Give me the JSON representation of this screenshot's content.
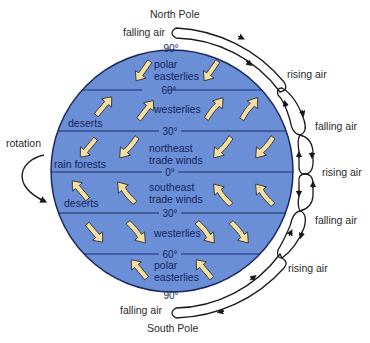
{
  "diagram": {
    "poles": {
      "north": "North Pole",
      "south": "South Pole"
    },
    "latitudes": [
      "90°",
      "60°",
      "30°",
      "0°",
      "30°",
      "60°",
      "90°"
    ],
    "wind_belts": {
      "north_polar": [
        "polar",
        "easterlies"
      ],
      "north_westerlies": "westerlies",
      "northeast_trades": [
        "northeast",
        "trade winds"
      ],
      "southeast_trades": [
        "southeast",
        "trade winds"
      ],
      "south_westerlies": "westerlies",
      "south_polar": [
        "polar",
        "easterlies"
      ]
    },
    "climate_zones": {
      "north_deserts": "deserts",
      "rain_forests": "rain forests",
      "south_deserts": "deserts"
    },
    "rotation_label": "rotation",
    "cell_labels": {
      "north_pole": "falling air",
      "north_60": "rising air",
      "north_30": "falling air",
      "equator": "rising air",
      "south_30": "falling air",
      "south_60": "rising air",
      "south_pole": "falling air"
    },
    "colors": {
      "globe_fill": "#6b8fd6",
      "globe_stroke": "#1a2a5a",
      "arrow_fill": "#f3dfa3",
      "arrow_stroke": "#3a3a3a",
      "cell_stroke": "#1a1a1a"
    }
  }
}
